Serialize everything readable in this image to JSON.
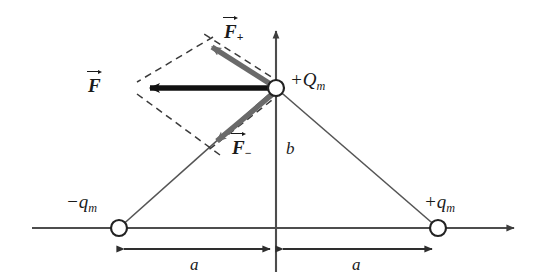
{
  "figure": {
    "type": "physics-vector-diagram",
    "background_color": "#ffffff"
  },
  "labels": {
    "center_charge": {
      "sign": "+",
      "symbol": "Q",
      "subscript": "m"
    },
    "left_charge": {
      "sign": "−",
      "symbol": "q",
      "subscript": "m"
    },
    "right_charge": {
      "sign": "+",
      "symbol": "q",
      "subscript": "m"
    },
    "force_plus": {
      "symbol": "F",
      "subscript": "+"
    },
    "force_minus": {
      "symbol": "F",
      "subscript": "−"
    },
    "force_resultant": {
      "symbol": "F",
      "subscript": ""
    },
    "height_label": "b",
    "distance_left_label": "a",
    "distance_right_label": "a"
  },
  "colors": {
    "axis": "#4d4d4d",
    "triangle": "#555555",
    "vector_component": "#6a6a6a",
    "vector_resultant": "#111111",
    "dashed_construction": "#3a3a3a",
    "node_fill": "#ffffff",
    "node_stroke": "#222222",
    "text": "#1a1a1a"
  },
  "geometry": {
    "origin": {
      "x": 276,
      "y": 228
    },
    "center_charge_point": {
      "x": 276,
      "y": 88
    },
    "left_charge_point": {
      "x": 119,
      "y": 228
    },
    "right_charge_point": {
      "x": 438,
      "y": 228
    },
    "force_plus_tip": {
      "x": 208,
      "y": 43
    },
    "force_minus_tip": {
      "x": 212,
      "y": 146
    },
    "force_resultant_tip": {
      "x": 143,
      "y": 88
    },
    "vertical_axis_top": {
      "x": 276,
      "y": 27
    },
    "horizontal_axis_left": {
      "x": 32,
      "y": 228
    },
    "horizontal_axis_right": {
      "x": 518,
      "y": 228
    },
    "dimension_line_y": 249,
    "node_radius": 8
  }
}
